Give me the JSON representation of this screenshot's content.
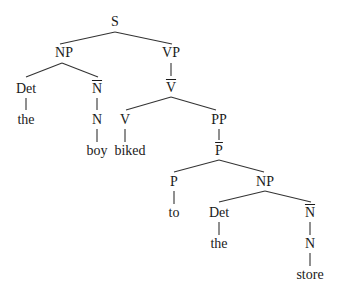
{
  "tree": {
    "nodes": [
      {
        "id": "S",
        "label": "S",
        "x": 115,
        "y": 22,
        "bar": false
      },
      {
        "id": "NP1",
        "label": "NP",
        "x": 64,
        "y": 53,
        "bar": false
      },
      {
        "id": "VP",
        "label": "VP",
        "x": 171,
        "y": 53,
        "bar": false
      },
      {
        "id": "Det1",
        "label": "Det",
        "x": 26,
        "y": 89,
        "bar": false
      },
      {
        "id": "Nbar1",
        "label": "N",
        "x": 97,
        "y": 89,
        "bar": true
      },
      {
        "id": "Vbar",
        "label": "V",
        "x": 171,
        "y": 88,
        "bar": true
      },
      {
        "id": "the1",
        "label": "the",
        "x": 26,
        "y": 120,
        "bar": false
      },
      {
        "id": "N1",
        "label": "N",
        "x": 97,
        "y": 120,
        "bar": false
      },
      {
        "id": "V",
        "label": "V",
        "x": 125,
        "y": 120,
        "bar": false
      },
      {
        "id": "PP",
        "label": "PP",
        "x": 219,
        "y": 120,
        "bar": false
      },
      {
        "id": "boy",
        "label": "boy",
        "x": 97,
        "y": 151,
        "bar": false
      },
      {
        "id": "biked",
        "label": "biked",
        "x": 130,
        "y": 151,
        "bar": false
      },
      {
        "id": "Pbar",
        "label": "P",
        "x": 219,
        "y": 151,
        "bar": true
      },
      {
        "id": "P",
        "label": "P",
        "x": 174,
        "y": 182,
        "bar": false
      },
      {
        "id": "NP2",
        "label": "NP",
        "x": 265,
        "y": 182,
        "bar": false
      },
      {
        "id": "to",
        "label": "to",
        "x": 174,
        "y": 213,
        "bar": false
      },
      {
        "id": "Det2",
        "label": "Det",
        "x": 219,
        "y": 213,
        "bar": false
      },
      {
        "id": "Nbar2",
        "label": "N",
        "x": 310,
        "y": 213,
        "bar": true
      },
      {
        "id": "the2",
        "label": "the",
        "x": 219,
        "y": 244,
        "bar": false
      },
      {
        "id": "N2",
        "label": "N",
        "x": 310,
        "y": 244,
        "bar": false
      },
      {
        "id": "store",
        "label": "store",
        "x": 310,
        "y": 275,
        "bar": false
      }
    ],
    "edges": [
      {
        "from": "S",
        "to": "NP1",
        "x1": 115,
        "y1": 32,
        "x2": 60,
        "y2": 44
      },
      {
        "from": "S",
        "to": "VP",
        "x1": 115,
        "y1": 32,
        "x2": 172,
        "y2": 44
      },
      {
        "from": "NP1",
        "to": "Det1",
        "x1": 62,
        "y1": 63,
        "x2": 26,
        "y2": 77
      },
      {
        "from": "NP1",
        "to": "Nbar1",
        "x1": 62,
        "y1": 63,
        "x2": 98,
        "y2": 77
      },
      {
        "from": "VP",
        "to": "Vbar",
        "x1": 171,
        "y1": 63,
        "x2": 171,
        "y2": 76
      },
      {
        "from": "Det1",
        "to": "the1",
        "x1": 26,
        "y1": 98,
        "x2": 26,
        "y2": 110
      },
      {
        "from": "Nbar1",
        "to": "N1",
        "x1": 97,
        "y1": 98,
        "x2": 97,
        "y2": 110
      },
      {
        "from": "Vbar",
        "to": "V",
        "x1": 171,
        "y1": 97,
        "x2": 126,
        "y2": 110
      },
      {
        "from": "Vbar",
        "to": "PP",
        "x1": 171,
        "y1": 97,
        "x2": 216,
        "y2": 110
      },
      {
        "from": "N1",
        "to": "boy",
        "x1": 97,
        "y1": 129,
        "x2": 97,
        "y2": 142
      },
      {
        "from": "V",
        "to": "biked",
        "x1": 125,
        "y1": 129,
        "x2": 125,
        "y2": 142
      },
      {
        "from": "PP",
        "to": "Pbar",
        "x1": 219,
        "y1": 129,
        "x2": 219,
        "y2": 140
      },
      {
        "from": "Pbar",
        "to": "P",
        "x1": 219,
        "y1": 160,
        "x2": 174,
        "y2": 172
      },
      {
        "from": "Pbar",
        "to": "NP2",
        "x1": 219,
        "y1": 160,
        "x2": 264,
        "y2": 172
      },
      {
        "from": "P",
        "to": "to",
        "x1": 174,
        "y1": 191,
        "x2": 174,
        "y2": 204
      },
      {
        "from": "NP2",
        "to": "Det2",
        "x1": 265,
        "y1": 191,
        "x2": 219,
        "y2": 202
      },
      {
        "from": "NP2",
        "to": "Nbar2",
        "x1": 265,
        "y1": 191,
        "x2": 311,
        "y2": 202
      },
      {
        "from": "Det2",
        "to": "the2",
        "x1": 219,
        "y1": 222,
        "x2": 219,
        "y2": 235
      },
      {
        "from": "Nbar2",
        "to": "N2",
        "x1": 310,
        "y1": 222,
        "x2": 310,
        "y2": 235
      },
      {
        "from": "N2",
        "to": "store",
        "x1": 310,
        "y1": 253,
        "x2": 310,
        "y2": 266
      }
    ],
    "line_color": "#333333",
    "text_color": "#1a1a1a"
  }
}
